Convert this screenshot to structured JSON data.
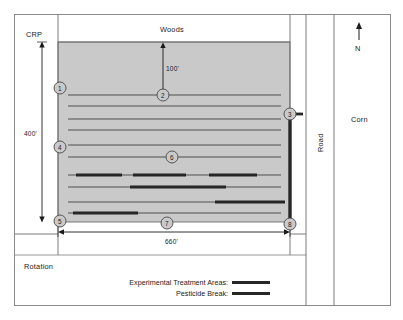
{
  "diagram": {
    "regions": {
      "crp": "CRP",
      "woods": "Woods",
      "rotation": "Rotation",
      "road": "Road",
      "corn": "Corn"
    },
    "compass": {
      "north_label": "N",
      "icon": "north-arrow-icon"
    },
    "dimensions": {
      "field_height": "400'",
      "field_width": "660'",
      "setback": "100'"
    },
    "markers": [
      {
        "id": "1",
        "label": "1",
        "x": 60,
        "y": 88
      },
      {
        "id": "2",
        "label": "2",
        "x": 163,
        "y": 95
      },
      {
        "id": "3",
        "label": "3",
        "x": 290,
        "y": 114
      },
      {
        "id": "4",
        "label": "4",
        "x": 60,
        "y": 147
      },
      {
        "id": "5",
        "label": "5",
        "x": 60,
        "y": 221
      },
      {
        "id": "6",
        "label": "6",
        "x": 172,
        "y": 157
      },
      {
        "id": "7",
        "label": "7",
        "x": 167,
        "y": 223
      },
      {
        "id": "8",
        "label": "8",
        "x": 290,
        "y": 224
      }
    ],
    "legend": {
      "items": [
        {
          "label": "Experimental Treatment Areas:",
          "swatch_color": "#262626"
        },
        {
          "label": "Pesticide Break:",
          "swatch_color": "#262626"
        }
      ]
    },
    "colors": {
      "field_fill": "#c9c9c9",
      "border": "#6e6e6e",
      "line": "#3a3a3a",
      "bar": "#262626",
      "text": "#1b1b1b",
      "background": "#ffffff"
    },
    "field": {
      "rows_thin": 11,
      "treatment_bars": [
        {
          "row": 8,
          "segments": [
            [
              76,
              122
            ],
            [
              133,
              186
            ],
            [
              209,
              257
            ]
          ]
        },
        {
          "row": 9,
          "segments": [
            [
              130,
              226
            ]
          ]
        },
        {
          "row": 10,
          "segments": [
            [
              215,
              285
            ]
          ]
        },
        {
          "row": 11,
          "segments": [
            [
              73,
              138
            ]
          ]
        }
      ],
      "pesticide_break": {
        "orientation": "vertical",
        "from_marker": "3",
        "to_marker": "8"
      }
    }
  }
}
